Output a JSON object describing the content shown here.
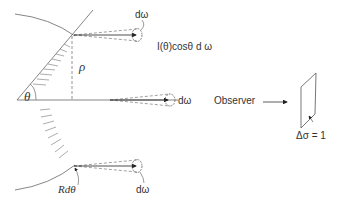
{
  "diagram": {
    "type": "radiometry-lambert-cosine",
    "labels": {
      "theta": "θ",
      "rho": "ρ",
      "d_omega_top": "dω",
      "d_omega_middle": "dω",
      "d_omega_bottom": "dω",
      "intensity": "I(θ)cosθ d ω",
      "observer": "Observer",
      "delta_sigma": "Δσ = 1",
      "r_dtheta": "Rdθ"
    },
    "colors": {
      "line": "#555555",
      "dash": "#777777",
      "text": "#333333"
    }
  }
}
